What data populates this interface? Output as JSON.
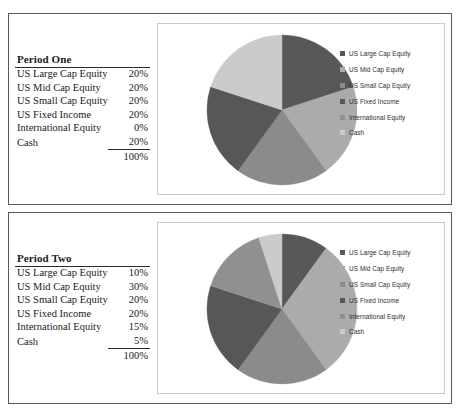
{
  "colors": {
    "us_large_cap": "#585858",
    "us_mid_cap": "#ababab",
    "us_small_cap": "#8b8b8b",
    "us_fixed_income": "#575757",
    "international_equity": "#909090",
    "cash": "#cbcbcb",
    "panel_border": "#5a5a5a",
    "chartbox_border": "#c9c9c9",
    "rule": "#2b2b2b",
    "text": "#1a1a1a"
  },
  "periods": [
    {
      "title": "Period One",
      "rows": [
        {
          "label": "US Large Cap Equity",
          "value": "20%"
        },
        {
          "label": "US Mid Cap Equity",
          "value": "20%"
        },
        {
          "label": "US Small Cap Equity",
          "value": "20%"
        },
        {
          "label": "US Fixed Income",
          "value": "20%"
        },
        {
          "label": "International Equity",
          "value": "0%"
        },
        {
          "label": "Cash",
          "value": "20%"
        }
      ],
      "total": "100%",
      "legend": [
        {
          "label": "US Large Cap Equity",
          "color": "#585858"
        },
        {
          "label": "US Mid Cap Equity",
          "color": "#ababab"
        },
        {
          "label": "US Small Cap Equity",
          "color": "#8b8b8b"
        },
        {
          "label": "US Fixed Income",
          "color": "#575757"
        },
        {
          "label": "International Equity",
          "color": "#909090"
        },
        {
          "label": "Cash",
          "color": "#cbcbcb"
        }
      ]
    },
    {
      "title": "Period Two",
      "rows": [
        {
          "label": "US Large Cap Equity",
          "value": "10%"
        },
        {
          "label": "US Mid Cap Equity",
          "value": "30%"
        },
        {
          "label": "US Small Cap Equity",
          "value": "20%"
        },
        {
          "label": "US Fixed Income",
          "value": "20%"
        },
        {
          "label": "International Equity",
          "value": "15%"
        },
        {
          "label": "Cash",
          "value": "5%"
        }
      ],
      "total": "100%",
      "legend": [
        {
          "label": "US Large Cap Equity",
          "color": "#585858"
        },
        {
          "label": "US Mid Cap Equity",
          "color": "#ababab"
        },
        {
          "label": "US Small Cap Equity",
          "color": "#8b8b8b"
        },
        {
          "label": "US Fixed Income",
          "color": "#575757"
        },
        {
          "label": "International Equity",
          "color": "#909090"
        },
        {
          "label": "Cash",
          "color": "#cbcbcb"
        }
      ]
    }
  ],
  "chart_data": [
    {
      "type": "pie",
      "title": "Period One",
      "categories": [
        "US Large Cap Equity",
        "US Mid Cap Equity",
        "US Small Cap Equity",
        "US Fixed Income",
        "International Equity",
        "Cash"
      ],
      "values": [
        20,
        20,
        20,
        20,
        0,
        20
      ],
      "unit": "%",
      "total": 100,
      "colors": [
        "#585858",
        "#ababab",
        "#8b8b8b",
        "#575757",
        "#909090",
        "#cbcbcb"
      ],
      "start_angle_deg": 0,
      "direction": "clockwise",
      "legend_position": "right"
    },
    {
      "type": "pie",
      "title": "Period Two",
      "categories": [
        "US Large Cap Equity",
        "US Mid Cap Equity",
        "US Small Cap Equity",
        "US Fixed Income",
        "International Equity",
        "Cash"
      ],
      "values": [
        10,
        30,
        20,
        20,
        15,
        5
      ],
      "unit": "%",
      "total": 100,
      "colors": [
        "#585858",
        "#ababab",
        "#8b8b8b",
        "#575757",
        "#909090",
        "#cbcbcb"
      ],
      "start_angle_deg": 0,
      "direction": "clockwise",
      "legend_position": "right"
    }
  ]
}
